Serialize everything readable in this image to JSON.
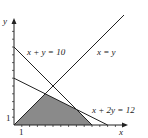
{
  "diagram": {
    "type": "linear-programming-feasible-region",
    "axes": {
      "x_label": "x",
      "y_label": "y",
      "x_tick_label": "1",
      "y_tick_label": "1",
      "x_range": [
        0,
        14
      ],
      "y_range": [
        0,
        11
      ]
    },
    "lines": [
      {
        "equation": "x + y = 10",
        "label": "x + y = 10"
      },
      {
        "equation": "x = y",
        "label": "x = y"
      },
      {
        "equation": "x + 2y = 12",
        "label": "x + 2y = 12"
      }
    ],
    "shaded_region": {
      "description": "feasible region bounded by y=0, x=y, x+2y=12, x+y=10",
      "vertices": [
        [
          0,
          0
        ],
        [
          4,
          4
        ],
        [
          8,
          2
        ],
        [
          10,
          0
        ]
      ],
      "color": "#8a8a8a"
    }
  }
}
